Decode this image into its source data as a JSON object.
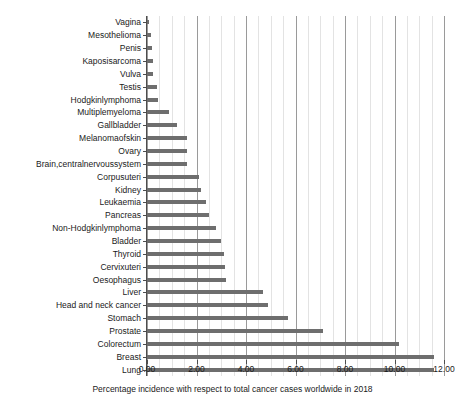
{
  "chart_data": {
    "type": "bar",
    "orientation": "horizontal",
    "title": "",
    "xlabel": "Percentage incidence with respect to total cancer cases worldwide in 2018",
    "ylabel": "",
    "xlim": [
      0.0,
      12.0
    ],
    "xticks": [
      "0.00",
      "2.00",
      "4.00",
      "6.00",
      "8.00",
      "10.00",
      "12.00"
    ],
    "xtick_values": [
      0,
      2,
      4,
      6,
      8,
      10,
      12
    ],
    "grid": "vertical-major-and-minor",
    "minor_tick_step": 0.5,
    "legend": "none",
    "bar_color": "#6e6e6e",
    "categories": [
      "Vagina",
      "Mesothelioma",
      "Penis",
      "Kaposisarcoma",
      "Vulva",
      "Testis",
      "Hodgkinlymphoma",
      "Multiplemyeloma",
      "Gallbladder",
      "Melanomaofskin",
      "Ovary",
      "Brain,centralnervoussystem",
      "Corpusuteri",
      "Kidney",
      "Leukaemia",
      "Pancreas",
      "Non-Hodgkinlymphoma",
      "Bladder",
      "Thyroid",
      "Cervixuteri",
      "Oesophagus",
      "Liver",
      "Head and neck cancer",
      "Stomach",
      "Prostate",
      "Colorectum",
      "Breast",
      "Lung"
    ],
    "values": [
      0.1,
      0.17,
      0.2,
      0.23,
      0.25,
      0.4,
      0.44,
      0.9,
      1.2,
      1.6,
      1.6,
      1.6,
      2.1,
      2.2,
      2.4,
      2.5,
      2.8,
      3.0,
      3.1,
      3.15,
      3.2,
      4.7,
      4.9,
      5.7,
      7.1,
      10.2,
      11.6,
      11.6
    ]
  }
}
